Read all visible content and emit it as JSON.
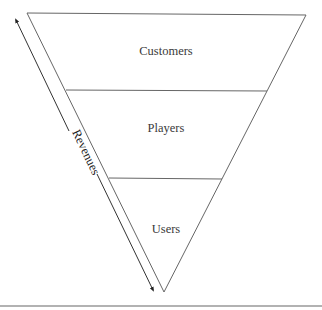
{
  "diagram": {
    "type": "inverted-funnel",
    "levels": [
      {
        "label": "Customers"
      },
      {
        "label": "Players"
      },
      {
        "label": "Users"
      }
    ],
    "side_axis": {
      "label": "Revenues",
      "direction": "bidirectional-arrow"
    }
  },
  "colors": {
    "line": "#555555",
    "arrow": "#222222",
    "text": "#3a3a3a",
    "rule": "#666666"
  }
}
